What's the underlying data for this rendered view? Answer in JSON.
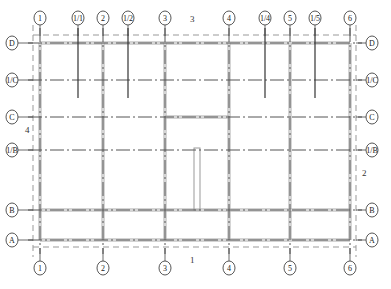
{
  "drawing": {
    "title": "Floor plan axis grid",
    "side_labels": {
      "top": "3",
      "bottom": "1",
      "right": "2",
      "left": "4"
    },
    "top_axes": [
      "1",
      "1/1",
      "2",
      "1/2",
      "3",
      "4",
      "1/4",
      "5",
      "1/5",
      "6"
    ],
    "bottom_axes": [
      "1",
      "2",
      "3",
      "4",
      "5",
      "6"
    ],
    "left_axes": [
      "D",
      "1/C",
      "C",
      "1/B",
      "B",
      "A"
    ],
    "right_axes": [
      "D",
      "1/C",
      "C",
      "1/B",
      "B",
      "A"
    ]
  }
}
